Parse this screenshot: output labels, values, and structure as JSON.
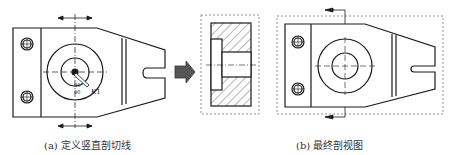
{
  "captions": {
    "a": "(a) 定义竖直剖切线",
    "b": "(b) 最终剖视图"
  },
  "annotations": {
    "angle_a": "90°",
    "angle_b": "90",
    "point_label": "K1"
  },
  "colors": {
    "line": "#1a1a1a",
    "arrow_fill": "#555555",
    "dashed": "#777777",
    "hatch": "#444444"
  }
}
